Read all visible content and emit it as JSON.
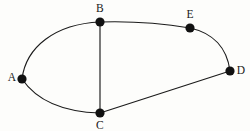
{
  "figure": {
    "kind": "undirected-graph-diagram",
    "width": 250,
    "height": 131,
    "background_color": "#fdfdfb",
    "ink_color": "#1b1b1b",
    "label_color": "#181818",
    "title": ""
  },
  "chart_data": {
    "type": "diagram",
    "title": "",
    "xlabel": "",
    "ylabel": "",
    "grid": false,
    "legend": "none",
    "vertices": [
      {
        "id": "A",
        "label": "A",
        "x": 22,
        "y": 79,
        "label_x": 12,
        "label_y": 78,
        "label_position": "left",
        "degree": 2
      },
      {
        "id": "B",
        "label": "B",
        "x": 100,
        "y": 22,
        "label_x": 100,
        "label_y": 9,
        "label_position": "above",
        "degree": 3
      },
      {
        "id": "C",
        "label": "C",
        "x": 100,
        "y": 113,
        "label_x": 100,
        "label_y": 126,
        "label_position": "below",
        "degree": 3
      },
      {
        "id": "D",
        "label": "D",
        "x": 230,
        "y": 71,
        "label_x": 241,
        "label_y": 71,
        "label_position": "right",
        "degree": 2
      },
      {
        "id": "E",
        "label": "E",
        "x": 190,
        "y": 28,
        "label_x": 190,
        "label_y": 15,
        "label_position": "above",
        "degree": 2
      }
    ],
    "edges": [
      {
        "id": "A-B",
        "from": "A",
        "to": "B",
        "style": "curved",
        "bow": "outward-upper-left",
        "path": "M 22 79 C 26 47 55 24 100 22"
      },
      {
        "id": "A-C",
        "from": "A",
        "to": "C",
        "style": "curved",
        "bow": "outward-lower-left",
        "path": "M 22 79 C 37 101 64 112 100 113"
      },
      {
        "id": "B-C",
        "from": "B",
        "to": "C",
        "style": "straight",
        "bow": "none",
        "path": "M 100 22 L 100 113"
      },
      {
        "id": "B-E",
        "from": "B",
        "to": "E",
        "style": "slightly-curved",
        "bow": "slight-sag",
        "path": "M 100 22 C 130 21 166 24 190 28"
      },
      {
        "id": "E-D",
        "from": "E",
        "to": "D",
        "style": "curved",
        "bow": "outward-right",
        "path": "M 190 28 C 213 33 227 48 230 71"
      },
      {
        "id": "C-D",
        "from": "C",
        "to": "D",
        "style": "straight",
        "bow": "none",
        "path": "M 100 113 L 230 71"
      }
    ],
    "vertex_count": 5,
    "edge_count": 6,
    "vertex_marker": {
      "shape": "circle",
      "radius": 4.6,
      "fill": "#111111"
    }
  }
}
